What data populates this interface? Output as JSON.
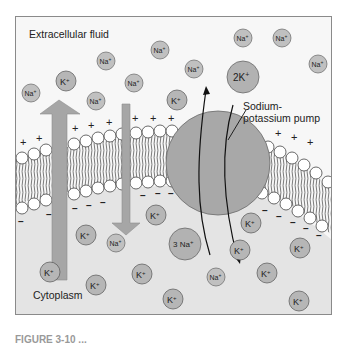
{
  "labels": {
    "extracellular": "Extracellular fluid",
    "cytoplasm": "Cytoplasm",
    "pump_line1": "Sodium-",
    "pump_line2": "potassium pump",
    "caption_partial": "FIGURE 3-10 ..."
  },
  "pump": {
    "outbound_label": "2K",
    "outbound_sup": "+",
    "inbound_label": "3 Na",
    "inbound_sup": "+"
  },
  "colors": {
    "extracellular_bg": "#f7f7f7",
    "cytoplasm_bg": "#e4e4e4",
    "ion_fill": "#b9b9b9",
    "pump_fill": "#a8a8a8",
    "arrow_fill": "#a6a6a6",
    "border": "#8a8a8a"
  },
  "ions": {
    "na": "Na",
    "k": "K",
    "sup": "+"
  },
  "charges": {
    "outside": "+",
    "inside": "–"
  }
}
